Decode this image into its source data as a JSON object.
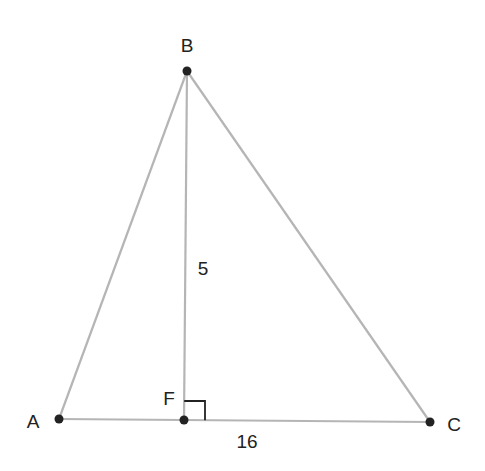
{
  "diagram": {
    "type": "geometry-triangle",
    "points": {
      "A": {
        "label": "A",
        "x": 59,
        "y": 419,
        "label_x": 33,
        "label_y": 428
      },
      "B": {
        "label": "B",
        "x": 187,
        "y": 71,
        "label_x": 187,
        "label_y": 52
      },
      "C": {
        "label": "C",
        "x": 430,
        "y": 422,
        "label_x": 454,
        "label_y": 431
      },
      "F": {
        "label": "F",
        "x": 184,
        "y": 420,
        "label_x": 169,
        "label_y": 405
      }
    },
    "segments": [
      {
        "from": "A",
        "to": "B"
      },
      {
        "from": "B",
        "to": "C"
      },
      {
        "from": "A",
        "to": "C"
      },
      {
        "from": "B",
        "to": "F"
      }
    ],
    "measurements": {
      "BF": {
        "text": "5",
        "x": 203,
        "y": 275
      },
      "FC": {
        "text": "16",
        "x": 247,
        "y": 448
      }
    },
    "right_angle": {
      "at": "F",
      "size": 20
    },
    "colors": {
      "line": "#b5b5b5",
      "point": "#222222",
      "text": "#222222"
    }
  }
}
